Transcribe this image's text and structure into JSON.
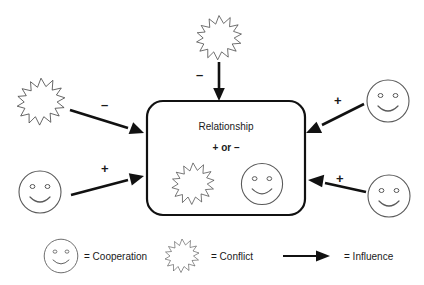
{
  "diagram": {
    "colors": {
      "background": "#ffffff",
      "line": "#111111",
      "burst_stroke": "#3a3a3a",
      "smiley_stroke": "#5a5a5a",
      "text": "#1a1a1a"
    },
    "center_box": {
      "title": "Relationship",
      "subtitle": "+ or –",
      "icons": [
        "conflict-burst",
        "cooperation-smiley"
      ]
    },
    "influences": [
      {
        "id": "top-conflict",
        "source_icon": "conflict-burst",
        "sign": "–",
        "direction": "down",
        "target": "center-box"
      },
      {
        "id": "left-upper-conflict",
        "source_icon": "conflict-burst",
        "sign": "–",
        "direction": "down-right",
        "target": "center-box"
      },
      {
        "id": "left-lower-cooperation",
        "source_icon": "cooperation-smiley",
        "sign": "+",
        "direction": "up-right",
        "target": "center-box"
      },
      {
        "id": "right-upper-cooperation",
        "source_icon": "cooperation-smiley",
        "sign": "+",
        "direction": "down-left",
        "target": "center-box"
      },
      {
        "id": "right-lower-cooperation",
        "source_icon": "cooperation-smiley",
        "sign": "+",
        "direction": "up-left",
        "target": "center-box"
      }
    ],
    "legend": {
      "items": [
        {
          "icon": "cooperation-smiley",
          "label": "= Cooperation"
        },
        {
          "icon": "conflict-burst",
          "label": "= Conflict"
        },
        {
          "icon": "influence-arrow",
          "label": "= Influence"
        }
      ]
    }
  }
}
